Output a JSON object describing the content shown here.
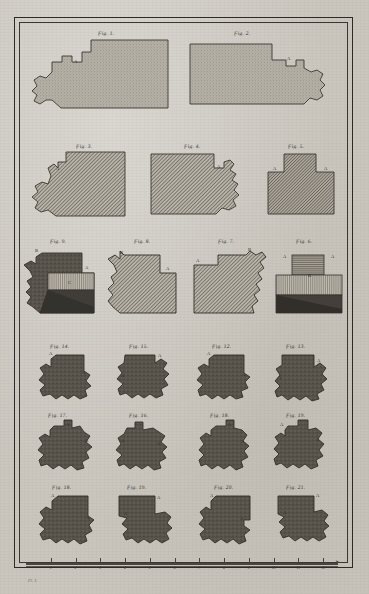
{
  "plate": {
    "bottom_caption": "Pl. I.",
    "border_style": "double-ruled"
  },
  "figures": [
    {
      "id": "fig1",
      "label": "Fig. 1.",
      "marks": [
        "A"
      ]
    },
    {
      "id": "fig2",
      "label": "Fig. 2.",
      "marks": [
        "A"
      ]
    },
    {
      "id": "fig3",
      "label": "Fig. 3.",
      "marks": [
        "A"
      ]
    },
    {
      "id": "fig4",
      "label": "Fig. 4.",
      "marks": [
        "A"
      ]
    },
    {
      "id": "fig5",
      "label": "Fig. 5.",
      "marks": [
        "A",
        "A"
      ]
    },
    {
      "id": "fig9",
      "label": "Fig. 9.",
      "marks": [
        "B",
        "A",
        "C"
      ]
    },
    {
      "id": "fig8",
      "label": "Fig. 8.",
      "marks": [
        "B",
        "A"
      ]
    },
    {
      "id": "fig7",
      "label": "Fig. 7.",
      "marks": [
        "A",
        "B"
      ]
    },
    {
      "id": "fig6",
      "label": "Fig. 6.",
      "marks": [
        "A",
        "A",
        "B"
      ]
    },
    {
      "id": "fig14",
      "label": "Fig. 14.",
      "marks": [
        "A",
        "A"
      ]
    },
    {
      "id": "fig15",
      "label": "Fig. 15.",
      "marks": [
        "A",
        "A"
      ]
    },
    {
      "id": "fig12",
      "label": "Fig. 12.",
      "marks": [
        "A",
        "A"
      ]
    },
    {
      "id": "fig13",
      "label": "Fig. 13.",
      "marks": [
        "A",
        "A"
      ]
    },
    {
      "id": "fig17",
      "label": "Fig. 17.",
      "marks": [
        "A",
        "A"
      ]
    },
    {
      "id": "fig16",
      "label": "Fig. 16.",
      "marks": [
        "A",
        "A"
      ]
    },
    {
      "id": "fig18b",
      "label": "Fig. 18.",
      "marks": [
        "A",
        "A"
      ]
    },
    {
      "id": "fig19b",
      "label": "Fig. 19.",
      "marks": [
        "A",
        "A"
      ]
    },
    {
      "id": "fig18",
      "label": "Fig. 18.",
      "marks": [
        "A",
        "A"
      ]
    },
    {
      "id": "fig19",
      "label": "Fig. 19.",
      "marks": [
        "A",
        "A"
      ]
    },
    {
      "id": "fig20",
      "label": "Fig. 20.",
      "marks": [
        "A",
        "A"
      ]
    },
    {
      "id": "fig21",
      "label": "Fig. 21.",
      "marks": [
        "A",
        "A"
      ]
    }
  ],
  "scale": {
    "ticks": [
      "1",
      "2",
      "3",
      "4",
      "5",
      "6",
      "7",
      "8",
      "9",
      "10",
      "11",
      "12"
    ],
    "arrow": "➤"
  },
  "colors": {
    "ink": "#35322d",
    "paper": "#cac6be",
    "fill_light": "#b3aea4",
    "fill_mid": "#8d8779",
    "fill_dark": "#55504a",
    "fill_verydark": "#3e3a35"
  }
}
